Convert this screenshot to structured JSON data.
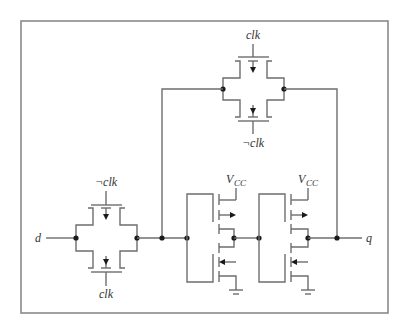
{
  "diagram": {
    "type": "circuit-schematic",
    "labels": {
      "input": "d",
      "output": "q",
      "top_gate_upper_clock": "clk",
      "top_gate_lower_clock": "¬clk",
      "input_gate_upper_clock": "¬clk",
      "input_gate_lower_clock": "clk",
      "inverter1_supply": "V",
      "inverter1_supply_sub": "CC",
      "inverter2_supply": "V",
      "inverter2_supply_sub": "CC"
    },
    "components": [
      {
        "name": "input-transmission-gate",
        "controls": [
          "¬clk",
          "clk"
        ]
      },
      {
        "name": "feedback-transmission-gate",
        "controls": [
          "clk",
          "¬clk"
        ]
      },
      {
        "name": "inverter-1",
        "supply": "VCC"
      },
      {
        "name": "inverter-2",
        "supply": "VCC"
      }
    ]
  }
}
